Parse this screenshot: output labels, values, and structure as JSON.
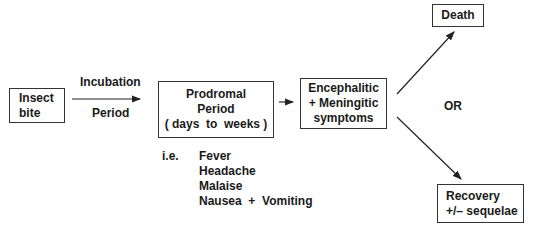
{
  "nodes": {
    "insect_bite": {
      "lines": [
        "Insect",
        "bite"
      ]
    },
    "prodromal": {
      "lines": [
        "Prodromal",
        "Period",
        "( days  to  weeks )"
      ]
    },
    "encephalitic": {
      "lines": [
        "Encephalitic",
        "+ Meningitic",
        "symptoms"
      ]
    },
    "death": {
      "label": "Death"
    },
    "recovery": {
      "lines": [
        "Recovery",
        "+/– sequelae"
      ]
    }
  },
  "edges": {
    "incubation": {
      "top": "Incubation",
      "bottom": "Period"
    },
    "or_label": "OR"
  },
  "symptoms": {
    "prefix": "i.e.",
    "items": [
      "Fever",
      "Headache",
      "Malaise",
      "Nausea  +  Vomiting"
    ]
  }
}
